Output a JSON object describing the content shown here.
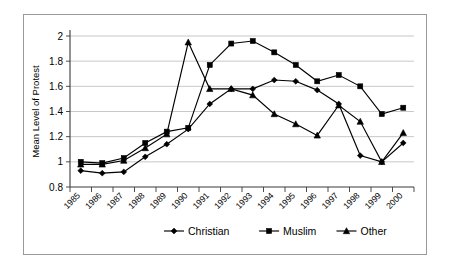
{
  "page": {
    "top_fragment": "",
    "background_color": "#ffffff",
    "border_color": "#9a9a9a"
  },
  "chart_data": {
    "type": "line",
    "title": "",
    "xlabel": "",
    "ylabel": "Mean Level of Protest",
    "ylim": [
      0.8,
      2
    ],
    "ytick_values": [
      "0.8",
      "1",
      "1.2",
      "1.4",
      "1.6",
      "1.8",
      "2"
    ],
    "grid": true,
    "legend_position": "bottom",
    "categories": [
      "1985",
      "1986",
      "1987",
      "1988",
      "1989",
      "1990",
      "1991",
      "1992",
      "1993",
      "1994",
      "1995",
      "1996",
      "1997",
      "1998",
      "1999",
      "2000"
    ],
    "series": [
      {
        "name": "Christian",
        "marker": "diamond",
        "color": "#000000",
        "values": [
          0.93,
          0.91,
          0.92,
          1.04,
          1.14,
          1.26,
          1.46,
          1.58,
          1.58,
          1.65,
          1.64,
          1.57,
          1.46,
          1.05,
          1.0,
          1.15
        ]
      },
      {
        "name": "Muslim",
        "marker": "square",
        "color": "#000000",
        "values": [
          1.0,
          0.99,
          1.03,
          1.15,
          1.24,
          1.27,
          1.77,
          1.94,
          1.96,
          1.87,
          1.77,
          1.64,
          1.69,
          1.6,
          1.38,
          1.43
        ]
      },
      {
        "name": "Other",
        "marker": "triangle",
        "color": "#000000",
        "values": [
          0.98,
          0.98,
          1.01,
          1.11,
          1.22,
          1.95,
          1.58,
          1.58,
          1.53,
          1.38,
          1.3,
          1.21,
          1.45,
          1.32,
          1.0,
          1.23
        ]
      }
    ],
    "legend": [
      {
        "label": "Christian",
        "marker": "diamond"
      },
      {
        "label": "Muslim",
        "marker": "square"
      },
      {
        "label": "Other",
        "marker": "triangle"
      }
    ]
  }
}
